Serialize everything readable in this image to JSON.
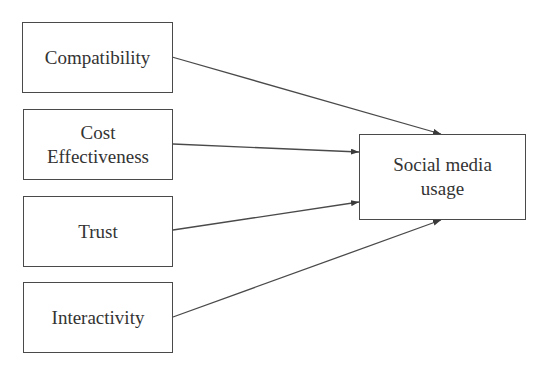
{
  "diagram": {
    "type": "path-model",
    "independent_variables": [
      {
        "id": "compatibility",
        "lines": [
          "Compatibility"
        ]
      },
      {
        "id": "cost-effectiveness",
        "lines": [
          "Cost",
          "Effectiveness"
        ]
      },
      {
        "id": "trust",
        "lines": [
          "Trust"
        ]
      },
      {
        "id": "interactivity",
        "lines": [
          "Interactivity"
        ]
      }
    ],
    "dependent_variable": {
      "id": "social-media-usage",
      "lines": [
        "Social media",
        "usage"
      ]
    },
    "edges": [
      {
        "from": "Compatibility",
        "to": "Social media usage"
      },
      {
        "from": "Cost Effectiveness",
        "to": "Social media usage"
      },
      {
        "from": "Trust",
        "to": "Social media usage"
      },
      {
        "from": "Interactivity",
        "to": "Social media usage"
      }
    ],
    "colors": {
      "stroke": "#4a4a4a",
      "text": "#333333",
      "background": "#ffffff"
    }
  }
}
